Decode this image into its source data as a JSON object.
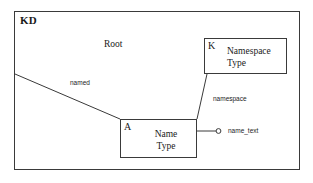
{
  "diagram": {
    "type": "entity-relationship-diagram",
    "container": {
      "label": "KD"
    },
    "floating_labels": [
      {
        "id": "root",
        "text": "Root"
      }
    ],
    "entities": [
      {
        "id": "namespace-type",
        "tag": "K",
        "line1": "Namespace",
        "line2": "Type"
      },
      {
        "id": "name-type",
        "tag": "A",
        "line1": "Name",
        "line2": "Type"
      }
    ],
    "edges": [
      {
        "id": "named",
        "label": "named"
      },
      {
        "id": "namespace",
        "label": "namespace"
      },
      {
        "id": "name-text",
        "label": "name_text"
      }
    ],
    "colors": {
      "stroke": "#3a3a3a",
      "text": "#1a1a1a",
      "background": "#ffffff"
    }
  }
}
